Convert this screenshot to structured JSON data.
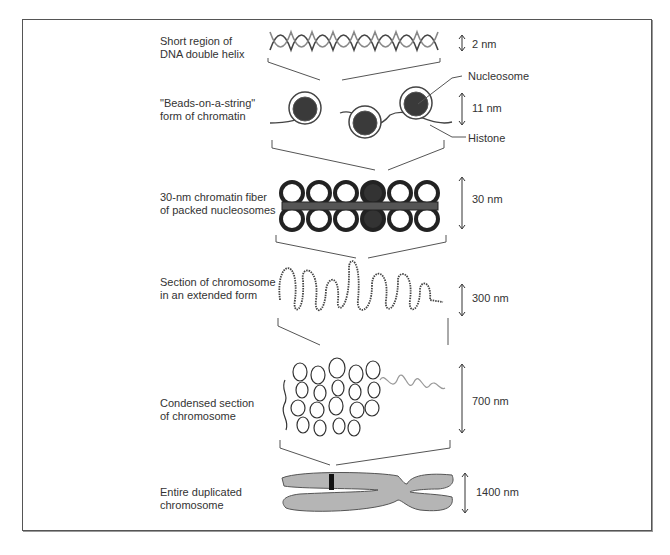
{
  "figure": {
    "levels": [
      {
        "id": "dna",
        "label": "Short region of\nDNA double helix",
        "scale": "2 nm"
      },
      {
        "id": "beads",
        "label": "\"Beads-on-a-string\"\nform of chromatin",
        "scale": "11 nm"
      },
      {
        "id": "fiber",
        "label": "30-nm chromatin fiber\nof packed nucleosomes",
        "scale": "30 nm"
      },
      {
        "id": "extended",
        "label": "Section of chromosome\nin an extended form",
        "scale": "300 nm"
      },
      {
        "id": "condensed",
        "label": "Condensed section\nof chromosome",
        "scale": "700 nm"
      },
      {
        "id": "chromosome",
        "label": "Entire duplicated\nchromosome",
        "scale": "1400 nm"
      }
    ],
    "callouts": {
      "nucleosome": "Nucleosome",
      "histone": "Histone"
    },
    "colors": {
      "nucleosome_fill": "#3a3a3a",
      "chromosome_fill": "#b5b5b5",
      "band": "#111111",
      "line": "#555555"
    }
  }
}
